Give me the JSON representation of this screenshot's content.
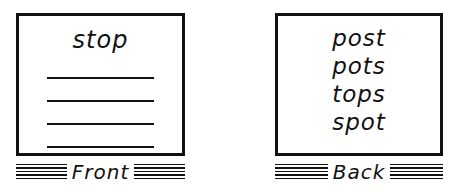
{
  "front": {
    "word": "stop",
    "blank_lines": 4,
    "label": "Front"
  },
  "back": {
    "words": [
      "post",
      "pots",
      "tops",
      "spot"
    ],
    "label": "Back"
  }
}
